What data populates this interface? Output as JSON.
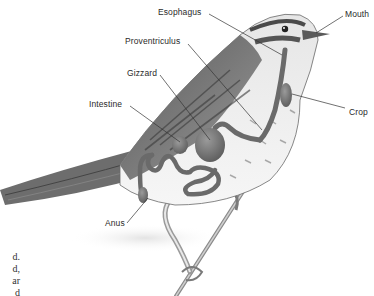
{
  "diagram": {
    "labels": [
      {
        "id": "esophagus",
        "text": "Esophagus"
      },
      {
        "id": "mouth",
        "text": "Mouth"
      },
      {
        "id": "proventriculus",
        "text": "Proventriculus"
      },
      {
        "id": "gizzard",
        "text": "Gizzard"
      },
      {
        "id": "intestine",
        "text": "Intestine"
      },
      {
        "id": "crop",
        "text": "Crop"
      },
      {
        "id": "anus",
        "text": "Anus"
      }
    ]
  },
  "background_text": {
    "fragments": [
      "d.",
      "d,",
      "ar",
      "d"
    ]
  }
}
